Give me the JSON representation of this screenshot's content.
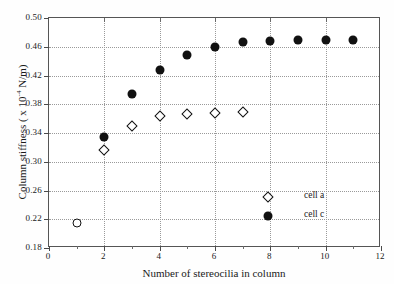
{
  "chart_data": {
    "type": "scatter",
    "title": "",
    "xlabel": "Number of stereocilia in column",
    "ylabel": "Column stiffness ( x 10",
    "ylabel_exponent": "-4",
    "ylabel_suffix": " N/m)",
    "xlim": [
      0,
      12
    ],
    "ylim": [
      0.18,
      0.5
    ],
    "xticks": [
      0,
      2,
      4,
      6,
      8,
      10,
      12
    ],
    "xticks_minor": [
      1,
      3,
      5,
      7,
      9,
      11
    ],
    "yticks": [
      0.18,
      0.22,
      0.26,
      0.3,
      0.34,
      0.38,
      0.42,
      0.46,
      0.5
    ],
    "xtick_labels": [
      "0",
      "2",
      "4",
      "6",
      "8",
      "10",
      "12"
    ],
    "ytick_labels": [
      "0.18",
      "0.22",
      "0.26",
      "0.30",
      "0.34",
      "0.38",
      "0.42",
      "0.46",
      "0.50"
    ],
    "grid": true,
    "grid_style": "dotted",
    "legend_position": "lower-right",
    "series": [
      {
        "name": "cell a",
        "marker": "open-diamond",
        "color": "#111111",
        "points": [
          {
            "x": 2,
            "y": 0.317
          },
          {
            "x": 3,
            "y": 0.35
          },
          {
            "x": 4,
            "y": 0.363
          },
          {
            "x": 5,
            "y": 0.367
          },
          {
            "x": 6,
            "y": 0.368
          },
          {
            "x": 7,
            "y": 0.369
          }
        ]
      },
      {
        "name": "cell c",
        "marker": "filled-circle",
        "color": "#111111",
        "points": [
          {
            "x": 2,
            "y": 0.334
          },
          {
            "x": 3,
            "y": 0.394
          },
          {
            "x": 4,
            "y": 0.428
          },
          {
            "x": 5,
            "y": 0.448
          },
          {
            "x": 6,
            "y": 0.46
          },
          {
            "x": 7,
            "y": 0.466
          },
          {
            "x": 8,
            "y": 0.468
          },
          {
            "x": 9,
            "y": 0.47
          },
          {
            "x": 10,
            "y": 0.47
          },
          {
            "x": 11,
            "y": 0.47
          }
        ]
      },
      {
        "name": "shared",
        "marker": "open-circle",
        "color": "#111111",
        "points": [
          {
            "x": 1,
            "y": 0.215
          }
        ]
      }
    ]
  },
  "legend": {
    "entries": [
      {
        "label": "cell a",
        "marker": "open-diamond"
      },
      {
        "label": "cell c",
        "marker": "filled-circle"
      }
    ]
  }
}
